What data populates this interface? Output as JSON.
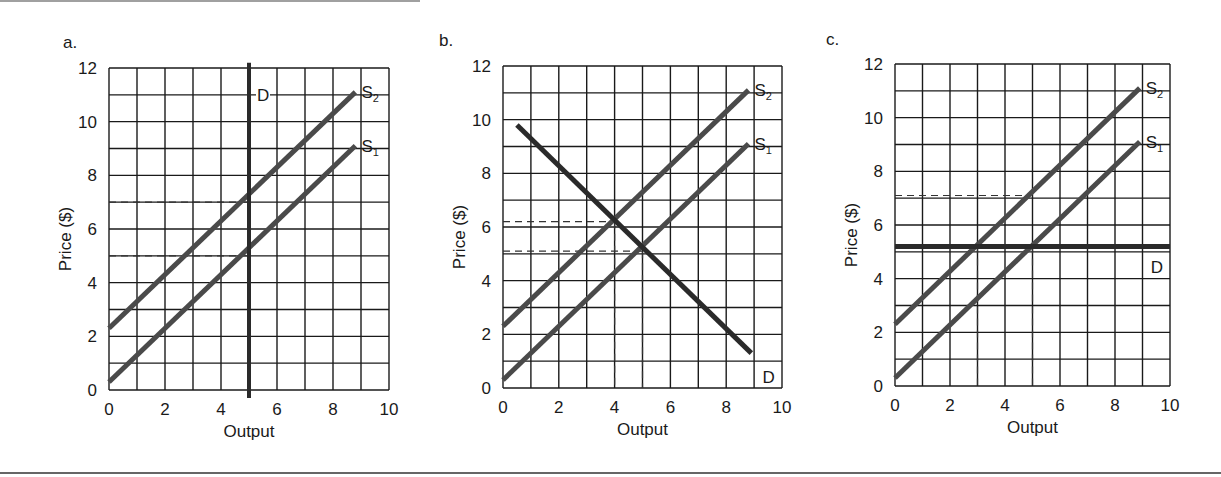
{
  "figure": {
    "panels": [
      "a.",
      "b.",
      "c."
    ],
    "xlabel": "Output",
    "ylabel": "Price ($)"
  },
  "colors": {
    "grid": "#1a1a1a",
    "supply": "#4a4a4a",
    "demand": "#2a2a2a",
    "dashed": "#333333"
  },
  "chart_data": [
    {
      "type": "line",
      "panel": "a.",
      "title": "",
      "xlabel": "Output",
      "ylabel": "Price ($)",
      "xlim": [
        0,
        10
      ],
      "ylim": [
        0,
        12
      ],
      "xticks": [
        0,
        2,
        4,
        6,
        8,
        10
      ],
      "yticks": [
        0,
        2,
        4,
        6,
        8,
        10,
        12
      ],
      "grid": true,
      "grid_step": 1,
      "series": [
        {
          "name": "S1",
          "label": "S",
          "sub": "1",
          "x": [
            0,
            8.8
          ],
          "y": [
            0.3,
            9.1
          ]
        },
        {
          "name": "S2",
          "label": "S",
          "sub": "2",
          "x": [
            0,
            8.8
          ],
          "y": [
            2.3,
            11.1
          ]
        },
        {
          "name": "D",
          "label": "D",
          "sub": "",
          "x": [
            5,
            5
          ],
          "y": [
            -0.3,
            12.2
          ],
          "style": "vertical"
        }
      ],
      "annotations": [
        {
          "type": "dashed",
          "x": [
            0,
            5
          ],
          "y": [
            7,
            7
          ]
        },
        {
          "type": "dashed",
          "x": [
            0,
            5
          ],
          "y": [
            5,
            5
          ]
        }
      ]
    },
    {
      "type": "line",
      "panel": "b.",
      "title": "",
      "xlabel": "Output",
      "ylabel": "Price ($)",
      "xlim": [
        0,
        10
      ],
      "ylim": [
        0,
        12
      ],
      "xticks": [
        0,
        2,
        4,
        6,
        8,
        10
      ],
      "yticks": [
        0,
        2,
        4,
        6,
        8,
        10,
        12
      ],
      "grid": true,
      "grid_step": 1,
      "series": [
        {
          "name": "S1",
          "label": "S",
          "sub": "1",
          "x": [
            0,
            8.8
          ],
          "y": [
            0.3,
            9.1
          ]
        },
        {
          "name": "S2",
          "label": "S",
          "sub": "2",
          "x": [
            0,
            8.8
          ],
          "y": [
            2.3,
            11.1
          ]
        },
        {
          "name": "D",
          "label": "D",
          "sub": "",
          "x": [
            0.5,
            8.9
          ],
          "y": [
            9.8,
            1.3
          ]
        }
      ],
      "annotations": [
        {
          "type": "dashed",
          "x": [
            0,
            4
          ],
          "y": [
            6.2,
            6.2
          ]
        },
        {
          "type": "dashed",
          "x": [
            0,
            5
          ],
          "y": [
            5.1,
            5.1
          ]
        },
        {
          "type": "dashed",
          "x": [
            4,
            4
          ],
          "y": [
            6.2,
            0
          ]
        },
        {
          "type": "dashed",
          "x": [
            5,
            5
          ],
          "y": [
            5.1,
            0
          ]
        }
      ]
    },
    {
      "type": "line",
      "panel": "c.",
      "title": "",
      "xlabel": "Output",
      "ylabel": "Price ($)",
      "xlim": [
        0,
        10
      ],
      "ylim": [
        0,
        12
      ],
      "xticks": [
        0,
        2,
        4,
        6,
        8,
        10
      ],
      "yticks": [
        0,
        2,
        4,
        6,
        8,
        10,
        12
      ],
      "grid": true,
      "grid_step": 1,
      "series": [
        {
          "name": "S1",
          "label": "S",
          "sub": "1",
          "x": [
            0,
            8.9
          ],
          "y": [
            0.3,
            9.1
          ]
        },
        {
          "name": "S2",
          "label": "S",
          "sub": "2",
          "x": [
            0,
            8.9
          ],
          "y": [
            2.3,
            11.1
          ]
        },
        {
          "name": "D",
          "label": "D",
          "sub": "",
          "x": [
            0,
            10
          ],
          "y": [
            5.2,
            5.2
          ],
          "style": "horizontal"
        }
      ],
      "annotations": [
        {
          "type": "dashed",
          "x": [
            0,
            4.8
          ],
          "y": [
            7.1,
            7.1
          ]
        },
        {
          "type": "dashed",
          "x": [
            3,
            3
          ],
          "y": [
            5.2,
            0
          ]
        },
        {
          "type": "dashed",
          "x": [
            5,
            5
          ],
          "y": [
            5.2,
            0
          ]
        }
      ]
    }
  ]
}
